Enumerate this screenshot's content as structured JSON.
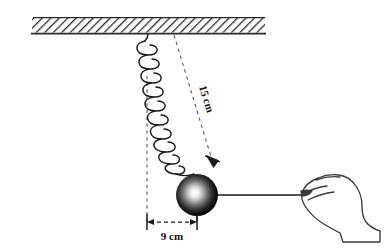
{
  "figure": {
    "kind": "physics-diagram",
    "background_color": "#ffffff",
    "ink_color": "#1a1a1a",
    "width": 390,
    "height": 250
  },
  "ceiling": {
    "name": "hatched ceiling support",
    "x": 32,
    "y": 18,
    "width": 233,
    "height": 15,
    "hatch_angle_deg": 45,
    "line_color": "#333333"
  },
  "spring": {
    "name": "coil spring",
    "anchor_x": 148,
    "anchor_y": 34,
    "end_x": 196,
    "end_y": 175,
    "coils": 14,
    "coil_radius": 19,
    "stroke_color": "#1a1a1a"
  },
  "ball": {
    "name": "suspended mass",
    "cx": 197,
    "cy": 195,
    "r": 21,
    "fill_center": "#ffffff",
    "fill_edge": "#000000"
  },
  "string": {
    "name": "pulling cord",
    "x1": 218,
    "y1": 195,
    "x2": 301,
    "y2": 195,
    "stroke_color": "#1a1a1a"
  },
  "hand": {
    "name": "hand pulling the cord",
    "stroke_color": "#333333",
    "fill_color": "#ffffff"
  },
  "dimensions": [
    {
      "id": "displacement-length",
      "label": "15 cm",
      "style": "dashed-diagonal-with-arrow",
      "from_x": 174,
      "from_y": 35,
      "to_x": 214,
      "to_y": 166,
      "rotation_deg": 73,
      "text_x": 203,
      "text_y": 100,
      "color": "#555555"
    },
    {
      "id": "horizontal-displacement",
      "label": "9 cm",
      "style": "dashed-horizontal-with-arrows",
      "from_x": 147,
      "from_y": 222,
      "to_x": 197,
      "to_y": 222,
      "text_x": 172,
      "text_y": 238,
      "color": "#1a1a1a"
    }
  ],
  "guides": [
    {
      "id": "vertical-equilibrium-guide",
      "style": "dashed-vertical",
      "x": 147,
      "y1": 76,
      "y2": 222,
      "color": "#555555"
    }
  ]
}
